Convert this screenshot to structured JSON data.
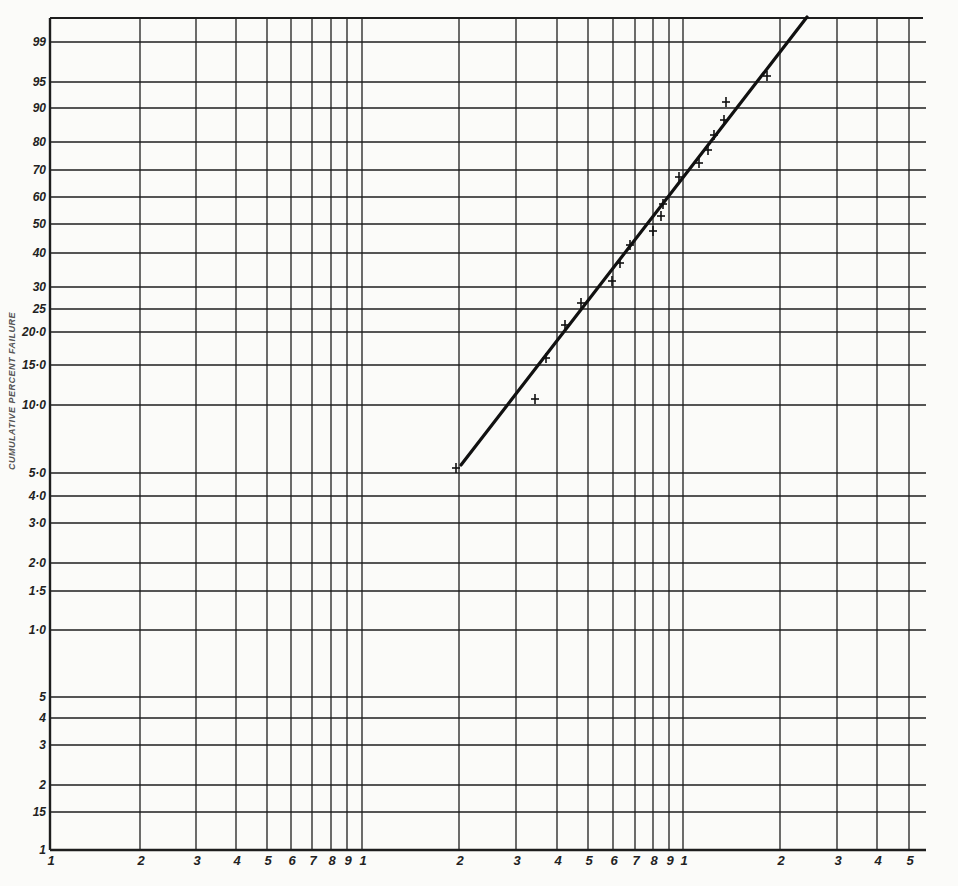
{
  "chart_data": {
    "type": "scatter",
    "subtype": "log-normal probability plot with fitted line",
    "title": "",
    "ylabel": "CUMULATIVE PERCENT FAILURE",
    "xlabel": "",
    "x_scale": "log (3 decades)",
    "y_scale": "probability",
    "grid": true,
    "y_ticks": [
      {
        "label": "99",
        "value": 99,
        "y": 42
      },
      {
        "label": "95",
        "value": 95,
        "y": 82
      },
      {
        "label": "90",
        "value": 90,
        "y": 108
      },
      {
        "label": "80",
        "value": 80,
        "y": 142
      },
      {
        "label": "70",
        "value": 70,
        "y": 170
      },
      {
        "label": "60",
        "value": 60,
        "y": 197
      },
      {
        "label": "50",
        "value": 50,
        "y": 224
      },
      {
        "label": "40",
        "value": 40,
        "y": 253
      },
      {
        "label": "30",
        "value": 30,
        "y": 287
      },
      {
        "label": "25",
        "value": 25,
        "y": 309
      },
      {
        "label": "20·0",
        "value": 20,
        "y": 332
      },
      {
        "label": "15·0",
        "value": 15,
        "y": 365
      },
      {
        "label": "10·0",
        "value": 10,
        "y": 405
      },
      {
        "label": "5·0",
        "value": 5,
        "y": 473
      },
      {
        "label": "4·0",
        "value": 4,
        "y": 496
      },
      {
        "label": "3·0",
        "value": 3,
        "y": 523
      },
      {
        "label": "2·0",
        "value": 2,
        "y": 563
      },
      {
        "label": "1·5",
        "value": 1.5,
        "y": 591
      },
      {
        "label": "1·0",
        "value": 1.0,
        "y": 630
      },
      {
        "label": "5",
        "value": 0.5,
        "y": 697
      },
      {
        "label": "4",
        "value": 0.4,
        "y": 718
      },
      {
        "label": "3",
        "value": 0.3,
        "y": 745
      },
      {
        "label": "2",
        "value": 0.2,
        "y": 785
      },
      {
        "label": "15",
        "value": 0.15,
        "y": 812
      },
      {
        "label": "1",
        "value": 0.1,
        "y": 850
      }
    ],
    "x_ticks": [
      {
        "label": "1",
        "x": 50
      },
      {
        "label": "2",
        "x": 140
      },
      {
        "label": "3",
        "x": 196
      },
      {
        "label": "4",
        "x": 236
      },
      {
        "label": "5",
        "x": 267
      },
      {
        "label": "6",
        "x": 291
      },
      {
        "label": "7",
        "x": 312
      },
      {
        "label": "8",
        "x": 331
      },
      {
        "label": "9",
        "x": 347
      },
      {
        "label": "1",
        "x": 362
      },
      {
        "label": "2",
        "x": 459
      },
      {
        "label": "3",
        "x": 516
      },
      {
        "label": "4",
        "x": 557
      },
      {
        "label": "5",
        "x": 588
      },
      {
        "label": "6",
        "x": 613
      },
      {
        "label": "7",
        "x": 635
      },
      {
        "label": "8",
        "x": 653
      },
      {
        "label": "9",
        "x": 669
      },
      {
        "label": "1",
        "x": 683
      },
      {
        "label": "2",
        "x": 780
      },
      {
        "label": "3",
        "x": 837
      },
      {
        "label": "4",
        "x": 877
      },
      {
        "label": "5",
        "x": 909
      }
    ],
    "plot_box": {
      "left": 50,
      "top": 18,
      "right": 926,
      "bottom": 850
    },
    "fit_line": {
      "x1": 461,
      "y1": 465,
      "x2": 807,
      "y2": 17
    },
    "series": [
      {
        "name": "observed failures",
        "marker": "+",
        "points_px": [
          [
            456,
            468
          ],
          [
            535,
            399
          ],
          [
            546,
            358
          ],
          [
            565,
            325
          ],
          [
            581,
            303
          ],
          [
            612,
            281
          ],
          [
            620,
            263
          ],
          [
            630,
            245
          ],
          [
            653,
            231
          ],
          [
            661,
            216
          ],
          [
            663,
            204
          ],
          [
            679,
            177
          ],
          [
            699,
            163
          ],
          [
            708,
            150
          ],
          [
            714,
            135
          ],
          [
            724,
            120
          ],
          [
            726,
            102
          ],
          [
            767,
            76
          ]
        ],
        "approx_percent": [
          5.0,
          10.0,
          15.0,
          21.0,
          26.0,
          31.0,
          36.0,
          42.0,
          47.0,
          52.0,
          57.0,
          67.0,
          72.0,
          77.0,
          81.0,
          86.0,
          91.0,
          95.5
        ]
      }
    ]
  }
}
